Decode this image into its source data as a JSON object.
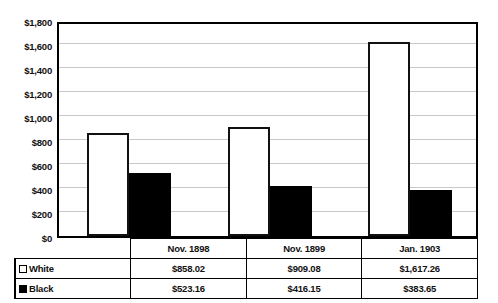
{
  "chart_data": {
    "type": "bar",
    "title": "",
    "xlabel": "",
    "ylabel": "",
    "categories": [
      "Nov. 1898",
      "Nov. 1899",
      "Jan. 1903"
    ],
    "series": [
      {
        "name": "White",
        "values": [
          858.02,
          909.08,
          1617.26
        ],
        "labels": [
          "$858.02",
          "$909.08",
          "$1,617.26"
        ],
        "color": "#ffffff"
      },
      {
        "name": "Black",
        "values": [
          523.16,
          416.15,
          383.65
        ],
        "labels": [
          "$523.16",
          "$416.15",
          "$383.65"
        ],
        "color": "#000000"
      }
    ],
    "ylim": [
      0,
      1800
    ],
    "yticks": [
      0,
      200,
      400,
      600,
      800,
      1000,
      1200,
      1400,
      1600,
      1800
    ],
    "ytick_labels": [
      "$0",
      "$200",
      "$400",
      "$600",
      "$800",
      "$1,000",
      "$1,200",
      "$1,400",
      "$1,600",
      "$1,800"
    ],
    "grid": true,
    "legend_position": "table-left"
  },
  "table": {
    "row_white_label": "White",
    "row_black_label": "Black",
    "categories": [
      "Nov. 1898",
      "Nov. 1899",
      "Jan. 1903"
    ],
    "white_values": [
      "$858.02",
      "$909.08",
      "$1,617.26"
    ],
    "black_values": [
      "$523.16",
      "$416.15",
      "$383.65"
    ]
  }
}
